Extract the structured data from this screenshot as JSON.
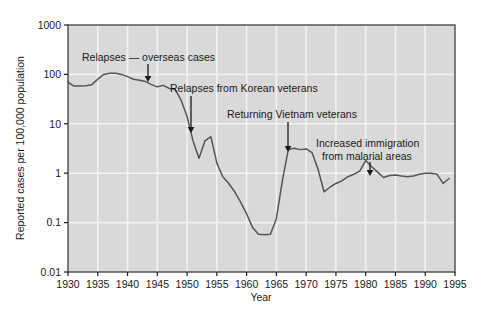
{
  "chart_data": {
    "type": "line",
    "title": "",
    "subtitle": "",
    "xlabel": "Year",
    "ylabel": "Reported cases per 100,000 population",
    "yscale": "log",
    "xscale": "linear",
    "xlim": [
      1930,
      1995
    ],
    "ylim": [
      0.01,
      1000
    ],
    "grid": true,
    "legend": false,
    "background_color": "#d9d9d9",
    "line_color": "#555555",
    "text_color": "#1a1a1a",
    "xticks": [
      1930,
      1935,
      1940,
      1945,
      1950,
      1955,
      1960,
      1965,
      1970,
      1975,
      1980,
      1985,
      1990,
      1995
    ],
    "xtick_labels": [
      "1930",
      "1935",
      "1940",
      "1945",
      "1950",
      "1955",
      "1960",
      "1965",
      "1970",
      "1975",
      "1980",
      "1985",
      "1990",
      "1995"
    ],
    "yticks": [
      0.01,
      0.1,
      1,
      10,
      100,
      1000
    ],
    "ytick_labels": [
      "0.01",
      "0.1",
      "1",
      "10",
      "100",
      "1000"
    ],
    "series": [
      {
        "name": "Reported malaria cases per 100,000 population",
        "x": [
          1930,
          1931,
          1932,
          1933,
          1934,
          1935,
          1936,
          1937,
          1938,
          1939,
          1940,
          1941,
          1942,
          1943,
          1944,
          1945,
          1946,
          1947,
          1948,
          1949,
          1950,
          1951,
          1952,
          1953,
          1954,
          1955,
          1956,
          1957,
          1958,
          1959,
          1960,
          1961,
          1962,
          1963,
          1964,
          1965,
          1966,
          1967,
          1968,
          1969,
          1970,
          1971,
          1972,
          1973,
          1974,
          1975,
          1976,
          1977,
          1978,
          1979,
          1980,
          1981,
          1982,
          1983,
          1984,
          1985,
          1986,
          1987,
          1988,
          1989,
          1990,
          1991,
          1992,
          1993,
          1994
        ],
        "y": [
          70,
          58,
          58,
          59,
          62,
          80,
          100,
          105,
          105,
          100,
          90,
          80,
          76,
          72,
          62,
          56,
          60,
          52,
          50,
          30,
          14,
          4.5,
          2.0,
          4.5,
          5.5,
          1.6,
          0.85,
          0.62,
          0.42,
          0.26,
          0.15,
          0.08,
          0.058,
          0.057,
          0.058,
          0.12,
          0.7,
          3.0,
          3.2,
          3.0,
          3.1,
          2.6,
          1.2,
          0.42,
          0.52,
          0.62,
          0.7,
          0.85,
          0.95,
          1.1,
          1.8,
          1.35,
          1.05,
          0.82,
          0.9,
          0.92,
          0.88,
          0.85,
          0.88,
          0.95,
          1.0,
          1.0,
          0.95,
          0.62,
          0.78
        ]
      }
    ],
    "annotations": [
      {
        "id": "relapses-overseas-cases",
        "text": "Relapses — overseas cases",
        "text_x": 82,
        "text_y": 61,
        "anchor": "start",
        "arrow": {
          "x1": 148,
          "y1": 64,
          "x2": 148,
          "y2": 82,
          "head": true
        }
      },
      {
        "id": "relapses-korean-veterans",
        "text": "Relapses from Korean veterans",
        "text_x": 170,
        "text_y": 92,
        "anchor": "start",
        "arrow": {
          "x1": 191,
          "y1": 96,
          "x2": 191,
          "y2": 133,
          "head": true
        }
      },
      {
        "id": "returning-vietnam-veterans",
        "text": "Returning Vietnam veterans",
        "text_x": 227,
        "text_y": 118,
        "anchor": "start",
        "arrow": {
          "x1": 288,
          "y1": 122,
          "x2": 288,
          "y2": 152,
          "head": true
        }
      },
      {
        "id": "increased-immigration-malarial-areas",
        "text_line1": "Increased immigration",
        "text_line2": "from malarial areas",
        "text_x": 316,
        "text_y": 147,
        "anchor": "start",
        "arrow": {
          "x1": 370,
          "y1": 162,
          "x2": 370,
          "y2": 176,
          "head": true
        }
      }
    ]
  },
  "figure": {
    "ylabel": "Reported cases per 100,000 population",
    "xlabel": "Year"
  },
  "labels": {
    "y": [
      "1000",
      "100",
      "10",
      "1",
      "0.1",
      "0.01"
    ],
    "x": [
      "1930",
      "1935",
      "1940",
      "1945",
      "1950",
      "1955",
      "1960",
      "1965",
      "1970",
      "1975",
      "1980",
      "1985",
      "1990",
      "1995"
    ]
  },
  "annotations": {
    "a0": "Relapses — overseas cases",
    "a1": "Relapses from Korean veterans",
    "a2": "Returning Vietnam veterans",
    "a3_line1": "Increased immigration",
    "a3_line2": "from malarial areas"
  }
}
